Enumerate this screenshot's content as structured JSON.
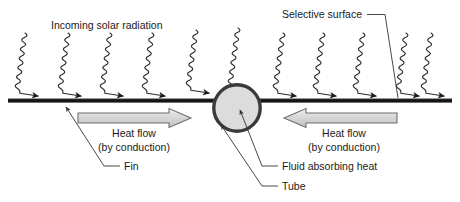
{
  "diagram": {
    "title_visible": false,
    "background_color": "#ffffff",
    "labels": {
      "incoming_solar_radiation": "Incoming solar radiation",
      "selective_surface": "Selective surface",
      "heat_flow_left_line1": "Heat flow",
      "heat_flow_left_line2": "(by conduction)",
      "heat_flow_right_line1": "Heat flow",
      "heat_flow_right_line2": "(by conduction)",
      "fin": "Fin",
      "fluid_absorbing_heat": "Fluid absorbing heat",
      "tube": "Tube"
    },
    "colors": {
      "line_dark": "#151515",
      "ray_stroke": "#2b2b2b",
      "tube_ring": "#3a3a3a",
      "tube_fill": "#dcdcdc",
      "block_arrow_fill_light": "#e8e8e8",
      "block_arrow_fill_mid": "#c9c9c9",
      "block_arrow_outline": "#6d6d6d",
      "text": "#1a1a1a",
      "leader": "#333333"
    },
    "components": {
      "fin_bar": {
        "name": "fin",
        "x1": 8,
        "x2": 452,
        "y": 100,
        "thickness": 4
      },
      "tube": {
        "name": "tube",
        "cx": 237,
        "cy": 108,
        "radius": 24,
        "ring_width": 3.4
      },
      "heat_flow_arrow_left": {
        "direction": "right",
        "x_start": 78,
        "x_end": 191,
        "y_center": 118,
        "body_height": 10,
        "head_height": 19
      },
      "heat_flow_arrow_right": {
        "direction": "left",
        "x_start": 397,
        "x_end": 284,
        "y_center": 118,
        "body_height": 10,
        "head_height": 19
      }
    },
    "solar_rays": {
      "count": 11,
      "description": "wavy zig-zag arrows slanting down-and-right toward the surface",
      "x_tops": [
        25,
        68,
        110,
        152,
        195,
        237,
        283,
        323,
        363,
        403,
        431
      ],
      "y_top": 33,
      "y_bottom": 97,
      "x_offset_bottom": 14,
      "amplitude": 3.2,
      "wavelength": 8.5
    },
    "leaders": [
      {
        "name": "selective-surface-leader",
        "label": "Selective surface",
        "from_text_x": 368,
        "from_text_y": 14,
        "dash_to_x": 384,
        "elbow_x": 388,
        "target_x": 398,
        "target_y": 99,
        "has_arrowhead": false
      },
      {
        "name": "fin-leader",
        "label": "Fin",
        "target_x": 63,
        "target_y": 104,
        "elbow_x": 104,
        "elbow_y": 166,
        "text_x": 124,
        "text_y": 170,
        "has_arrowhead": true
      },
      {
        "name": "fluid-leader",
        "label": "Fluid absorbing heat",
        "target_x": 238,
        "target_y": 107,
        "elbow_x": 262,
        "elbow_y": 166,
        "text_x": 282,
        "text_y": 170,
        "has_arrowhead": true
      },
      {
        "name": "tube-leader",
        "label": "Tube",
        "target_x": 219,
        "target_y": 123,
        "elbow_x": 262,
        "elbow_y": 186,
        "text_x": 282,
        "text_y": 190,
        "has_arrowhead": true
      }
    ]
  }
}
